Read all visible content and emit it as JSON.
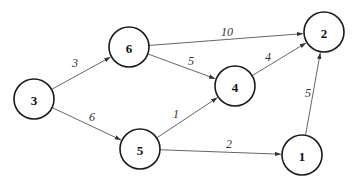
{
  "diagram": {
    "type": "weighted-directed-graph",
    "nodes": [
      {
        "id": "3",
        "label": "3",
        "x": 34,
        "y": 99
      },
      {
        "id": "6",
        "label": "6",
        "x": 129,
        "y": 47
      },
      {
        "id": "5",
        "label": "5",
        "x": 140,
        "y": 149
      },
      {
        "id": "4",
        "label": "4",
        "x": 235,
        "y": 86
      },
      {
        "id": "2",
        "label": "2",
        "x": 324,
        "y": 32
      },
      {
        "id": "1",
        "label": "1",
        "x": 302,
        "y": 155
      }
    ],
    "edges": [
      {
        "from": "3",
        "to": "6",
        "weight": "3",
        "lx": 75,
        "ly": 63
      },
      {
        "from": "3",
        "to": "5",
        "weight": "6",
        "lx": 92,
        "ly": 117
      },
      {
        "from": "6",
        "to": "2",
        "weight": "10",
        "lx": 227,
        "ly": 32
      },
      {
        "from": "6",
        "to": "4",
        "weight": "5",
        "lx": 191,
        "ly": 61
      },
      {
        "from": "5",
        "to": "4",
        "weight": "1",
        "lx": 176,
        "ly": 114
      },
      {
        "from": "5",
        "to": "1",
        "weight": "2",
        "lx": 229,
        "ly": 144
      },
      {
        "from": "4",
        "to": "2",
        "weight": "4",
        "lx": 268,
        "ly": 57
      },
      {
        "from": "1",
        "to": "2",
        "weight": "5",
        "lx": 308,
        "ly": 93
      }
    ]
  }
}
